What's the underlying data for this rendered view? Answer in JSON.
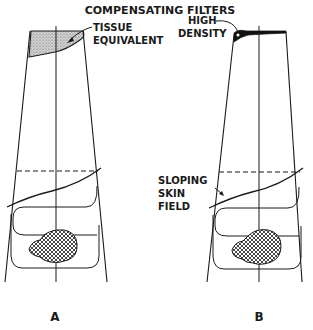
{
  "title": "COMPENSATING FILTERS",
  "panels": [
    {
      "id": "A",
      "label": "A",
      "filter_label_line1": "TISSUE",
      "filter_label_line2": "EQUIVALENT"
    },
    {
      "id": "B",
      "label": "B",
      "filter_label_line1": "HIGH",
      "filter_label_line2": "DENSITY",
      "skin_label_line1": "SLOPING",
      "skin_label_line2": "SKIN",
      "skin_label_line3": "FIELD"
    }
  ],
  "colors": {
    "ink": "#1a1a1a",
    "background": "#ffffff",
    "filter_fill_tissue": "#b8b8b8",
    "filter_fill_high_density": "#111111"
  }
}
